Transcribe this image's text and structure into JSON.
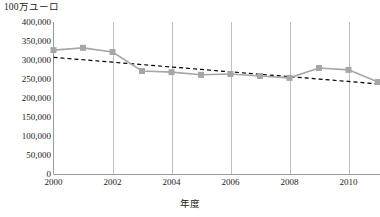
{
  "chart_data": {
    "type": "line",
    "title": "",
    "ylabel": "100万ユーロ",
    "xlabel": "年度",
    "ylim": [
      0,
      400000
    ],
    "xlim": [
      2000,
      2011
    ],
    "grid": "vertical",
    "legend": "none",
    "ytick_labels": [
      "400,000",
      "350,000",
      "300,000",
      "250,000",
      "200,000",
      "150,000",
      "100,000",
      "50,000",
      "0"
    ],
    "ytick_values": [
      400000,
      350000,
      300000,
      250000,
      200000,
      150000,
      100000,
      50000,
      0
    ],
    "xtick_labels": [
      "2000",
      "2002",
      "2004",
      "2006",
      "2008",
      "2010"
    ],
    "xtick_values": [
      2000,
      2002,
      2004,
      2006,
      2008,
      2010
    ],
    "x": [
      2000,
      2001,
      2002,
      2003,
      2004,
      2005,
      2006,
      2007,
      2008,
      2009,
      2010,
      2011
    ],
    "series": [
      {
        "name": "実績",
        "style": "line-marker",
        "color": "#a6a6a6",
        "marker": "square",
        "values": [
          326000,
          332000,
          321000,
          271000,
          268000,
          261000,
          263000,
          258000,
          253000,
          279000,
          274000,
          242000
        ]
      },
      {
        "name": "近似曲線",
        "style": "dashed-trendline",
        "color": "#000000",
        "marker": "none",
        "values": [
          307000,
          300600,
          294300,
          287900,
          281600,
          275200,
          268900,
          262500,
          256200,
          249800,
          243500,
          237100
        ]
      }
    ]
  },
  "colors": {
    "series_line": "#a6a6a6",
    "marker_fill": "#a6a6a6",
    "trendline": "#000000",
    "gridline": "#bfbfbf",
    "axis": "#9a9a9a",
    "text": "#1a1a1a",
    "background": "#ffffff"
  }
}
